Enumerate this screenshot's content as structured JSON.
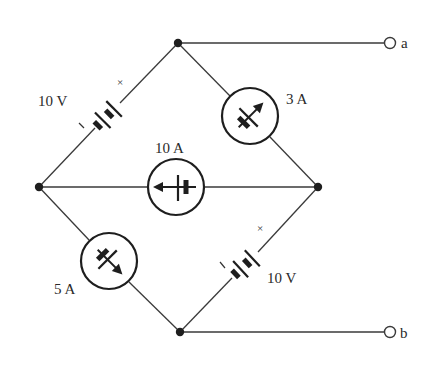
{
  "diagram": {
    "type": "circuit",
    "nodes": {
      "top": {
        "x": 178,
        "y": 43
      },
      "left": {
        "x": 39,
        "y": 187
      },
      "right": {
        "x": 318,
        "y": 187
      },
      "bottom": {
        "x": 180,
        "y": 332
      }
    },
    "terminals": [
      {
        "id": "a",
        "label": "a",
        "x": 390,
        "y": 43,
        "connects_to": "top"
      },
      {
        "id": "b",
        "label": "b",
        "x": 390,
        "y": 332,
        "connects_to": "bottom"
      }
    ],
    "components": [
      {
        "id": "v1",
        "type": "voltage-source",
        "label": "10 V",
        "branch": "left-top",
        "plus_marker": "+",
        "minus_marker": "-"
      },
      {
        "id": "i3",
        "type": "current-source",
        "label": "3 A",
        "branch": "top-right",
        "arrow_direction": "toward top node"
      },
      {
        "id": "i10",
        "type": "current-source",
        "label": "10 A",
        "branch": "left-right",
        "arrow_direction": "toward left node"
      },
      {
        "id": "i5",
        "type": "current-source",
        "label": "5 A",
        "branch": "left-bottom",
        "arrow_direction": "toward bottom node"
      },
      {
        "id": "v2",
        "type": "voltage-source",
        "label": "10 V",
        "branch": "bottom-right",
        "plus_marker": "+",
        "minus_marker": "-"
      }
    ]
  },
  "labels": {
    "v1": "10 V",
    "v1_plus": "×",
    "v1_minus": "ı",
    "i3": "3 A",
    "i10": "10 A",
    "i5": "5 A",
    "v2": "10 V",
    "v2_plus": "×",
    "v2_minus": "ı",
    "term_a": "a",
    "term_b": "b"
  }
}
